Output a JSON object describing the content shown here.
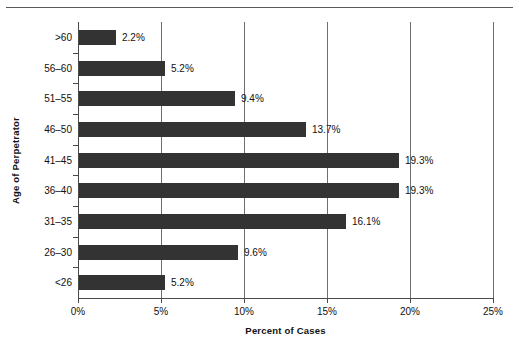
{
  "chart_data": {
    "type": "bar",
    "orientation": "horizontal",
    "title": "",
    "xlabel": "Percent of Cases",
    "ylabel": "Age of Perpetrator",
    "categories": [
      "<26",
      "26–30",
      "31–35",
      "36–40",
      "41–45",
      "46–50",
      "51–55",
      "56–60",
      ">60"
    ],
    "values": [
      5.2,
      9.6,
      16.1,
      19.3,
      19.3,
      13.7,
      9.4,
      5.2,
      2.2
    ],
    "data_labels": [
      "5.2%",
      "9.6%",
      "16.1%",
      "19.3%",
      "19.3%",
      "13.7%",
      "9.4%",
      "5.2%",
      "2.2%"
    ],
    "xlim": [
      0,
      25
    ],
    "xticks": [
      0,
      5,
      10,
      15,
      20,
      25
    ],
    "xtick_labels": [
      "0%",
      "5%",
      "10%",
      "15%",
      "20%",
      "25%"
    ],
    "grid": "vertical",
    "legend": "none",
    "bar_color": "#333333",
    "axis_color": "#4a4a4a",
    "gridline_color": "#6e6e6e",
    "background_color": "#ffffff"
  }
}
